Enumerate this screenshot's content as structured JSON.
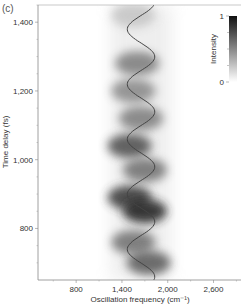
{
  "chart_data": {
    "type": "heatmap",
    "panel_label": "(c)",
    "title": "",
    "xlabel": "Oscillation frequency (cm⁻¹)",
    "ylabel": "Time delay (fs)",
    "xlim": [
      300,
      2960
    ],
    "ylim": [
      650,
      1450
    ],
    "x_ticks": [
      800,
      1400,
      2000,
      2600
    ],
    "x_tick_labels": [
      "800",
      "1,400",
      "2,000",
      "2,600"
    ],
    "y_ticks": [
      800,
      1000,
      1200,
      1400
    ],
    "y_tick_labels": [
      "800",
      "1,000",
      "1,200",
      "1,400"
    ],
    "colorbar": {
      "label": "Intensity",
      "min": 0,
      "max": 1,
      "tick_labels": [
        "0",
        "1"
      ],
      "colormap": "white-to-black"
    },
    "grid": false,
    "overlay_line": {
      "description": "Sinusoidal instantaneous frequency curve",
      "center_frequency": 1650,
      "amplitude": 180,
      "period_fs": 160,
      "color": "#444444"
    },
    "intensity_blobs": [
      {
        "time": 1420,
        "freq_center": 1550,
        "intensity": 0.25
      },
      {
        "time": 1280,
        "freq_center": 1600,
        "intensity": 0.55
      },
      {
        "time": 1200,
        "freq_center": 1550,
        "intensity": 0.5
      },
      {
        "time": 1120,
        "freq_center": 1650,
        "intensity": 0.55
      },
      {
        "time": 1040,
        "freq_center": 1500,
        "intensity": 0.75
      },
      {
        "time": 970,
        "freq_center": 1700,
        "intensity": 0.6
      },
      {
        "time": 890,
        "freq_center": 1500,
        "intensity": 0.85
      },
      {
        "time": 850,
        "freq_center": 1700,
        "intensity": 0.95
      },
      {
        "time": 760,
        "freq_center": 1550,
        "intensity": 0.6
      },
      {
        "time": 700,
        "freq_center": 1750,
        "intensity": 0.7
      }
    ],
    "colors": {
      "axis": "#888888",
      "text": "#333333",
      "line": "#444444"
    }
  }
}
